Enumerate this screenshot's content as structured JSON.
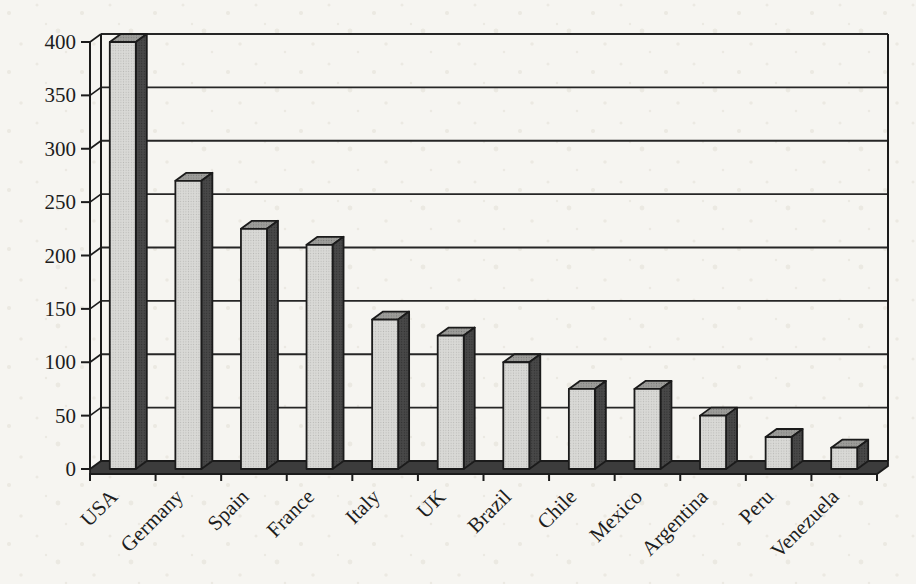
{
  "chart_data": {
    "type": "bar",
    "style": "3d-column, scanned grayscale halftone print",
    "title": "",
    "xlabel": "",
    "ylabel": "",
    "categories": [
      "USA",
      "Germany",
      "Spain",
      "France",
      "Italy",
      "UK",
      "Brazil",
      "Chile",
      "Mexico",
      "Argentina",
      "Peru",
      "Venezuela"
    ],
    "values": [
      400,
      270,
      225,
      210,
      140,
      125,
      100,
      75,
      75,
      50,
      30,
      20
    ],
    "ylim": [
      0,
      400
    ],
    "ytick_interval": 50,
    "ytick_labels": [
      "0",
      "50",
      "100",
      "150",
      "200",
      "250",
      "300",
      "350",
      "400"
    ],
    "grid": true,
    "legend": false,
    "x_label_rotation_deg": -45
  },
  "colors": {
    "paper": "#f6f5f1",
    "speckle": "#e7e4dc",
    "bar_face": "#d9d9d6",
    "bar_face_dot": "#b8b8b5",
    "bar_side": "#484848",
    "bar_side_dot": "#2e2e2e",
    "bar_top": "#9d9d9a",
    "bar_top_dot": "#797977",
    "floor": "#3c3c3c",
    "outline": "#1b1b1b",
    "gridline": "#262626",
    "ink": "#1d1d1d"
  }
}
